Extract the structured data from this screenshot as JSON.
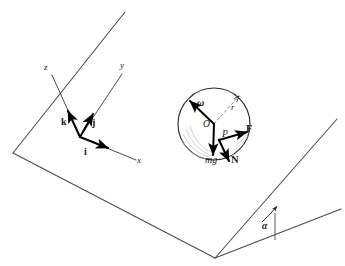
{
  "figure": {
    "kind": "physics-free-body-diagram",
    "stroke_color": "#2b2b2b",
    "accent_color": "#000000",
    "background": "#ffffff"
  },
  "axes": {
    "origin_label": "",
    "labels": {
      "x": "x",
      "y": "y",
      "z": "z"
    },
    "unit_vectors": [
      {
        "name": "i",
        "label": "i"
      },
      {
        "name": "j",
        "label": "j"
      },
      {
        "name": "k",
        "label": "k"
      }
    ]
  },
  "sphere": {
    "center_label": "O",
    "contact_point_label": "P",
    "radius_label": "r",
    "vectors": [
      {
        "name": "angular-velocity",
        "label": "ω"
      },
      {
        "name": "weight",
        "label": "mg"
      },
      {
        "name": "friction",
        "label": "F"
      },
      {
        "name": "normal",
        "label": "N"
      }
    ]
  },
  "incline": {
    "angle_label": "α"
  }
}
